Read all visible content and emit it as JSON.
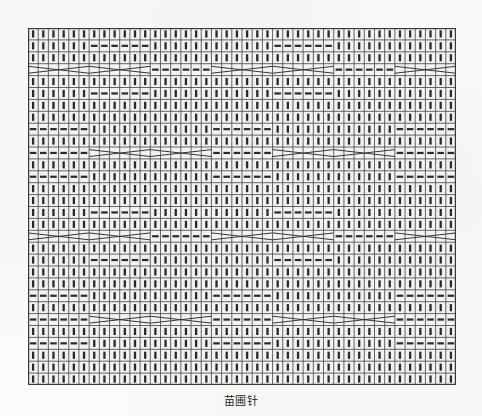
{
  "page": {
    "background_color": "#fcfcfb",
    "ink_color": "#2a2a2a",
    "cell_fill_color": "#f2f2f0"
  },
  "caption": {
    "text": "苗圃针",
    "position": "below-chart"
  },
  "chart_data": {
    "type": "table",
    "title": "苗圃针",
    "subtitle": "",
    "xlabel": "",
    "ylabel": "",
    "grid": true,
    "legend_position": "none",
    "columns": 42,
    "rows": 30,
    "cell_width_px": 10.19,
    "cell_height_px": 11.9,
    "symbols": {
      "knit": {
        "code": "I",
        "name": "knit-stitch",
        "glyph": "vertical-bar"
      },
      "purl": {
        "code": "-",
        "name": "purl-stitch",
        "glyph": "horizontal-dash"
      },
      "cable": {
        "code": "X",
        "name": "cable-cross",
        "glyph": "crossed-lines-span6"
      }
    },
    "legend": [
      {
        "symbol": "I",
        "label": "knit"
      },
      {
        "symbol": "-",
        "label": "purl"
      },
      {
        "symbol": "X",
        "label": "cable cross (6 st)"
      }
    ],
    "row_patterns": [
      "IIIIIIIIIIIIIIIIIIIIIIIIIIIIIIIIIIIIIIIIII",
      "IIIIII------IIIIIIIIIIII------IIIIIIIIIIII",
      "IIIIIIIIIIIIIIIIIIIIIIIIIIIIIIIIIIIIIIIIII",
      "XXXXXXXXXXXX------XXXXXXXXXXXX------XXXXXX",
      "IIIIIIIIIIIIIIIIIIIIIIIIIIIIIIIIIIIIIIIIII",
      "IIIIII------IIIIIIIIIIII------IIIIIIIIIIII",
      "IIIIIIIIIIIIIIIIIIIIIIIIIIIIIIIIIIIIIIIIII",
      "IIIIIIIIIIIIIIIIIIIIIIIIIIIIIIIIIIIIIIIIII",
      "------IIIIIIIIIIII------IIIIIIIIIIII------",
      "IIIIIIIIIIIIIIIIIIIIIIIIIIIIIIIIIIIIIIIIII",
      "------XXXXXXXXXXXX------XXXXXXXXXXXX------",
      "IIIIIIIIIIIIIIIIIIIIIIIIIIIIIIIIIIIIIIIIII",
      "------IIIIIIIIIIII------IIIIIIIIIIII------",
      "IIIIIIIIIIIIIIIIIIIIIIIIIIIIIIIIIIIIIIIIII",
      "IIIIIIIIIIIIIIIIIIIIIIIIIIIIIIIIIIIIIIIIII",
      "IIIIII------IIIIIIIIIIII------IIIIIIIIIIII",
      "IIIIIIIIIIIIIIIIIIIIIIIIIIIIIIIIIIIIIIIIII",
      "XXXXXXXXXXXX------XXXXXXXXXXXX------XXXXXX",
      "IIIIIIIIIIIIIIIIIIIIIIIIIIIIIIIIIIIIIIIIII",
      "IIIIII------IIIIIIIIIIII------IIIIIIIIIIII",
      "IIIIIIIIIIIIIIIIIIIIIIIIIIIIIIIIIIIIIIIIII",
      "IIIIIIIIIIIIIIIIIIIIIIIIIIIIIIIIIIIIIIIIII",
      "------IIIIIIIIIIII------IIIIIIIIIIII------",
      "IIIIIIIIIIIIIIIIIIIIIIIIIIIIIIIIIIIIIIIIII",
      "------XXXXXXXXXXXX------XXXXXXXXXXXX------",
      "IIIIIIIIIIIIIIIIIIIIIIIIIIIIIIIIIIIIIIIIII",
      "------IIIIIIIIIIII------IIIIIIIIIIII------",
      "IIIIIIIIIIIIIIIIIIIIIIIIIIIIIIIIIIIIIIIIII",
      "IIIIIIIIIIIIIIIIIIIIIIIIIIIIIIIIIIIIIIIIII",
      "IIIIIIIIIIIIIIIIIIIIIIIIIIIIIIIIIIIIIIIIII"
    ]
  }
}
